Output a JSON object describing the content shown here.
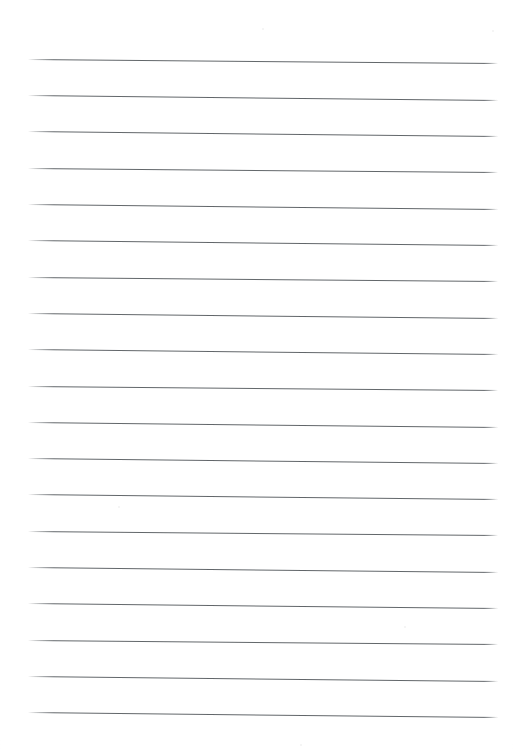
{
  "document": {
    "kind": "scanned-lined-paper",
    "title": "Lined Paper Sheet",
    "page_width": 515,
    "page_height": 749,
    "background_color": "#ffffff",
    "visible_text": "",
    "has_handwriting": false,
    "has_header": false,
    "has_margin_rule": false
  },
  "ruling": {
    "line_color": "#555a5e",
    "line_thickness_px": 1,
    "line_count": 19,
    "left_x": 28,
    "right_x": 498,
    "line_length_px": 470,
    "spacing_px": 36.3,
    "skew_degrees": 0.55,
    "first_line_y": 59,
    "last_line_y": 713,
    "lines": [
      {
        "index": 1,
        "y_left": 59,
        "y_right": 63
      },
      {
        "index": 2,
        "y_left": 95,
        "y_right": 100
      },
      {
        "index": 3,
        "y_left": 131,
        "y_right": 136
      },
      {
        "index": 4,
        "y_left": 168,
        "y_right": 172
      },
      {
        "index": 5,
        "y_left": 204,
        "y_right": 209
      },
      {
        "index": 6,
        "y_left": 240,
        "y_right": 245
      },
      {
        "index": 7,
        "y_left": 277,
        "y_right": 281
      },
      {
        "index": 8,
        "y_left": 313,
        "y_right": 318
      },
      {
        "index": 9,
        "y_left": 349,
        "y_right": 354
      },
      {
        "index": 10,
        "y_left": 386,
        "y_right": 390
      },
      {
        "index": 11,
        "y_left": 422,
        "y_right": 427
      },
      {
        "index": 12,
        "y_left": 458,
        "y_right": 463
      },
      {
        "index": 13,
        "y_left": 494,
        "y_right": 499
      },
      {
        "index": 14,
        "y_left": 531,
        "y_right": 535
      },
      {
        "index": 15,
        "y_left": 567,
        "y_right": 572
      },
      {
        "index": 16,
        "y_left": 603,
        "y_right": 608
      },
      {
        "index": 17,
        "y_left": 640,
        "y_right": 644
      },
      {
        "index": 18,
        "y_left": 676,
        "y_right": 681
      },
      {
        "index": 19,
        "y_left": 712,
        "y_right": 717
      }
    ]
  },
  "artifacts": {
    "specks": [
      {
        "x": 262,
        "y": 28,
        "size": 2
      },
      {
        "x": 492,
        "y": 30,
        "size": 2
      },
      {
        "x": 300,
        "y": 744,
        "size": 2
      },
      {
        "x": 118,
        "y": 506,
        "size": 2
      },
      {
        "x": 404,
        "y": 626,
        "size": 2
      }
    ]
  }
}
